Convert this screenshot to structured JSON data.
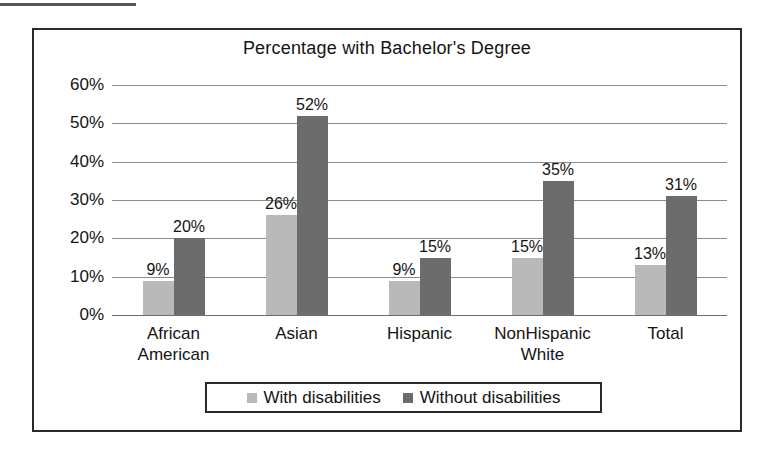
{
  "chart_data": {
    "type": "bar",
    "title": "Percentage with Bachelor's Degree",
    "xlabel": "",
    "ylabel": "",
    "ylim": [
      0,
      60
    ],
    "y_tick_labels": [
      "60%",
      "50%",
      "40%",
      "30%",
      "20%",
      "10%",
      "0%"
    ],
    "y_tick_values": [
      60,
      50,
      40,
      30,
      20,
      10,
      0
    ],
    "grid": true,
    "legend_position": "bottom",
    "categories": [
      "African\nAmerican",
      "Asian",
      "Hispanic",
      "NonHispanic\nWhite",
      "Total"
    ],
    "series": [
      {
        "name": "With disabilities",
        "color": "#b9b9b9",
        "values": [
          9,
          26,
          9,
          15,
          13
        ],
        "data_labels": [
          "9%",
          "26%",
          "9%",
          "15%",
          "13%"
        ]
      },
      {
        "name": "Without disabilities",
        "color": "#6c6c6c",
        "values": [
          20,
          52,
          15,
          35,
          31
        ],
        "data_labels": [
          "20%",
          "52%",
          "15%",
          "35%",
          "31%"
        ]
      }
    ]
  },
  "legend": {
    "items": [
      {
        "label": "With disabilities",
        "swatch": "#b9b9b9"
      },
      {
        "label": "Without disabilities",
        "swatch": "#6c6c6c"
      }
    ]
  }
}
